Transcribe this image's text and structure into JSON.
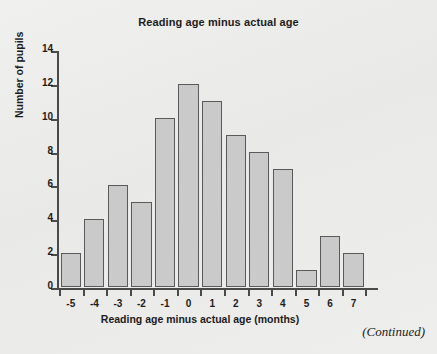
{
  "figure": {
    "background_color": "#ececeb",
    "continued_note": "(Continued)"
  },
  "chart_data": {
    "type": "bar",
    "title": "Reading age minus actual age",
    "xlabel": "Reading age minus actual age (months)",
    "ylabel": "Number of pupils",
    "categories": [
      "-5",
      "-4",
      "-3",
      "-2",
      "-1",
      "0",
      "1",
      "2",
      "3",
      "4",
      "5",
      "6",
      "7"
    ],
    "values": [
      2,
      4,
      6,
      5,
      10,
      12,
      11,
      9,
      8,
      7,
      1,
      3,
      2
    ],
    "xlim": [
      -5.5,
      7.5
    ],
    "ylim": [
      0,
      14
    ],
    "yticks": [
      0,
      2,
      4,
      6,
      8,
      10,
      12,
      14
    ],
    "ytick_labels": [
      "0",
      "2",
      "4",
      "6",
      "8",
      "10",
      "12",
      "14"
    ],
    "xtick_labels": [
      "-5",
      "-4",
      "-3",
      "-2",
      "-1",
      "0",
      "1",
      "2",
      "3",
      "4",
      "5",
      "6",
      "7"
    ],
    "grid": false,
    "legend": null,
    "bar_fill_color": "#cacaca",
    "bar_edge_color": "#5a5a5a"
  }
}
